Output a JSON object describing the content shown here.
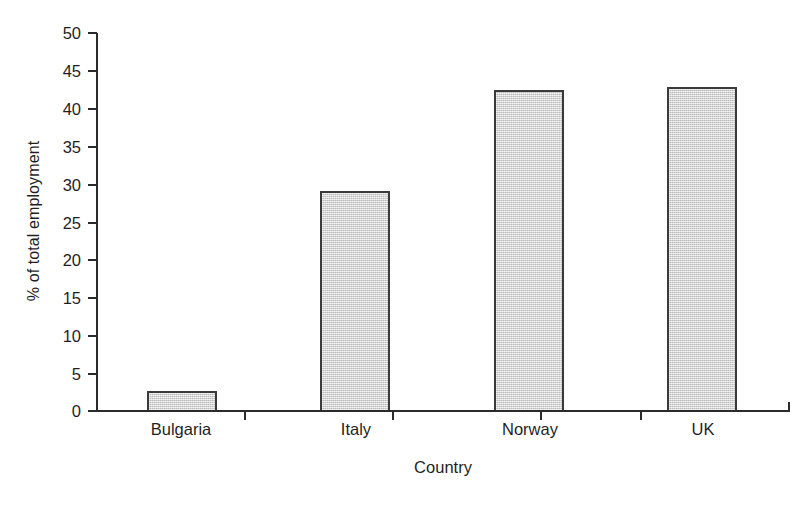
{
  "chart_data": {
    "type": "bar",
    "title": "",
    "subtitle": "",
    "xlabel": "Country",
    "ylabel": "% of total employment",
    "categories": [
      "Bulgaria",
      "Italy",
      "Norway",
      "UK"
    ],
    "values": [
      2.8,
      29.1,
      42.5,
      42.9
    ],
    "ylim": [
      0,
      50
    ],
    "ytick_labels": [
      "50",
      "45",
      "40",
      "35",
      "30",
      "25",
      "20",
      "15",
      "10",
      "5",
      "0"
    ],
    "ytick_values": [
      50,
      45,
      40,
      35,
      30,
      25,
      20,
      15,
      10,
      5,
      0
    ],
    "ytick_step": 5,
    "grid": false,
    "legend": false,
    "legend_position": "none",
    "annotations": [],
    "bar_fill_color": "#d2d2d2",
    "bar_edge_color": "#3a3a3a",
    "axis_color": "#2b2b2b",
    "background_color": "#ffffff"
  }
}
